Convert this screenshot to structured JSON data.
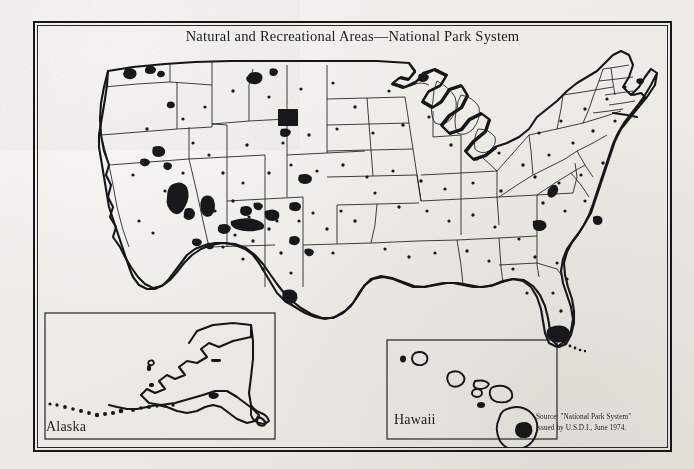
{
  "document": {
    "title": "Natural and Recreational Areas—National Park System",
    "medium": "scanned printed map",
    "paper_color": "#eeece7",
    "ink_color": "#17161a"
  },
  "title": {
    "text": "Natural and Recreational Areas—National Park System"
  },
  "insets": [
    {
      "name": "alaska",
      "label": "Alaska"
    },
    {
      "name": "hawaii",
      "label": "Hawaii"
    }
  ],
  "source": {
    "line1": "Source: \"National Park System\"",
    "line2": "issued by U.S.D.I., June 1974."
  },
  "map_data": {
    "type": "choropleth-point-map",
    "region": "United States of America",
    "projection": "conic",
    "symbology": {
      "park_areas": "solid black irregular polygons (large parks)",
      "park_points": "small black dots (small parks, monuments, historic sites)",
      "state_boundaries": "thin black lines",
      "national_coastline": "thick black line"
    },
    "insets_included": [
      "Alaska",
      "Hawaii"
    ],
    "notable_large_areas": [
      "Yellowstone (Wyoming)",
      "Grand Canyon (Arizona)",
      "Death Valley (California/Nevada)",
      "Yosemite / Sequoia / Kings Canyon (California)",
      "Olympic (Washington)",
      "Everglades (Florida)",
      "Big Bend (Texas)",
      "Hawaii Volcanoes (Hawaii)",
      "Glacier (Montana)"
    ],
    "legend": "none printed"
  }
}
